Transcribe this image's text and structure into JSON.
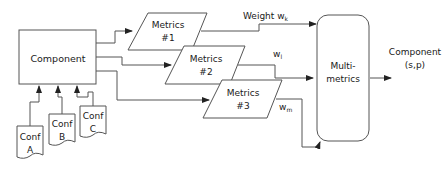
{
  "diagram": {
    "component": {
      "label": "Component"
    },
    "configs": [
      {
        "line1": "Conf",
        "line2": "A"
      },
      {
        "line1": "Conf",
        "line2": "B"
      },
      {
        "line1": "Conf",
        "line2": "C"
      }
    ],
    "metrics": [
      {
        "line1": "Metrics",
        "line2": "#1"
      },
      {
        "line1": "Metrics",
        "line2": "#2"
      },
      {
        "line1": "Metrics",
        "line2": "#3"
      }
    ],
    "weights": {
      "k_prefix": "Weight w",
      "k_sub": "k",
      "l_prefix": "w",
      "l_sub": "l",
      "m_prefix": "w",
      "m_sub": "m"
    },
    "multimetrics": {
      "line1": "Multi-",
      "line2": "metrics"
    },
    "output": {
      "line1": "Component",
      "line2": "(s,p)"
    }
  }
}
